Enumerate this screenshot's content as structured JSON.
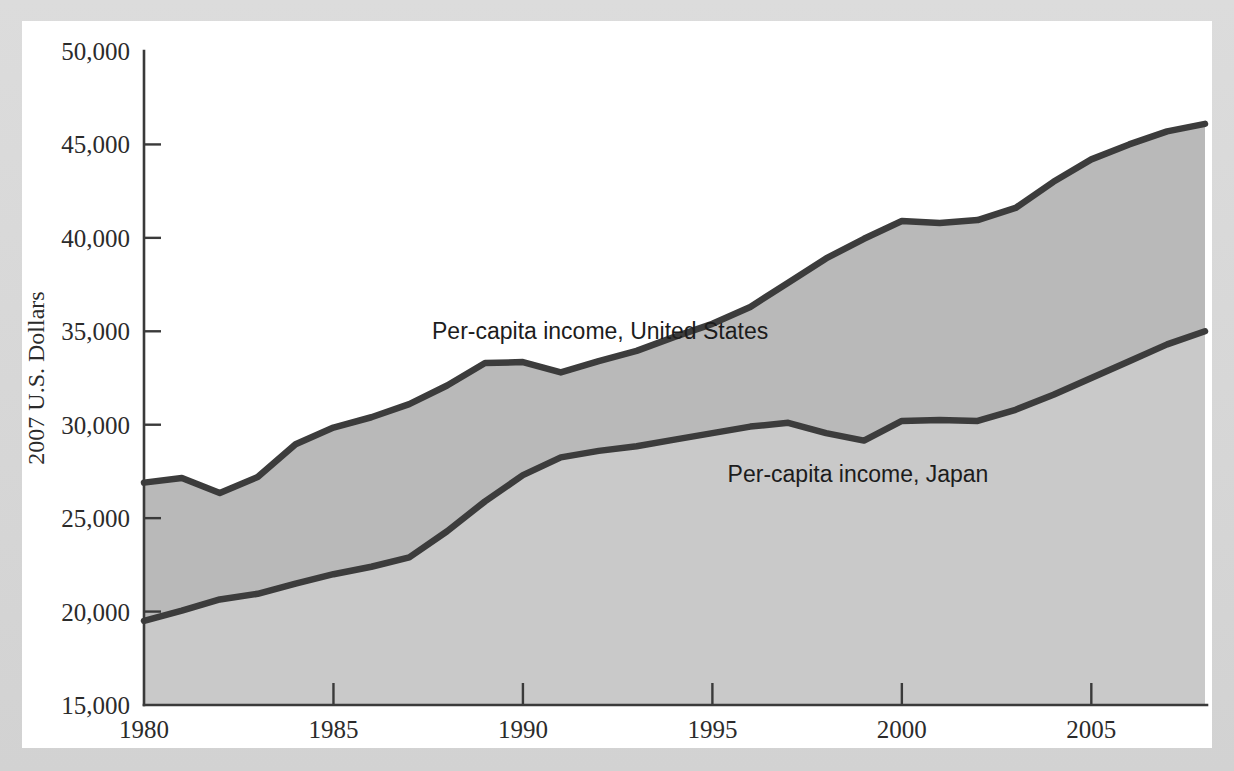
{
  "chart_data": {
    "type": "area",
    "title": "",
    "subtitle": "",
    "xlabel": "",
    "ylabel": "2007 U.S. Dollars",
    "xlim": [
      1980,
      2008
    ],
    "ylim": [
      15000,
      50000
    ],
    "grid": false,
    "legend_position": "inline-annotations",
    "y_ticks": [
      "50,000",
      "45,000",
      "40,000",
      "35,000",
      "30,000",
      "25,000",
      "20,000",
      "15,000"
    ],
    "y_tick_values": [
      50000,
      45000,
      40000,
      35000,
      30000,
      25000,
      20000,
      15000
    ],
    "x_ticks": [
      "1980",
      "1985",
      "1990",
      "1995",
      "2000",
      "2005"
    ],
    "x_tick_values": [
      1980,
      1985,
      1990,
      1995,
      2000,
      2005
    ],
    "x": [
      1980,
      1981,
      1982,
      1983,
      1984,
      1985,
      1986,
      1987,
      1988,
      1989,
      1990,
      1991,
      1992,
      1993,
      1994,
      1995,
      1996,
      1997,
      1998,
      1999,
      2000,
      2001,
      2002,
      2003,
      2004,
      2005,
      2006,
      2007,
      2008
    ],
    "series": [
      {
        "name": "Per-capita income, United States",
        "annotation": "Per-capita income, United States",
        "fill_color": "#b9b9b9",
        "line_color": "#3c3c3c",
        "values": [
          26900,
          27150,
          26350,
          27200,
          28950,
          29850,
          30400,
          31100,
          32100,
          33300,
          33350,
          32800,
          33400,
          33950,
          34700,
          35400,
          36300,
          37600,
          38900,
          39950,
          40900,
          40800,
          40950,
          41600,
          43000,
          44200,
          45000,
          45700,
          46100
        ]
      },
      {
        "name": "Per-capita income, Japan",
        "annotation": "Per-capita income, Japan",
        "fill_color": "#c9c9c9",
        "line_color": "#3c3c3c",
        "values": [
          19500,
          20050,
          20650,
          20950,
          21500,
          22000,
          22400,
          22900,
          24300,
          25900,
          27300,
          28250,
          28600,
          28850,
          29200,
          29550,
          29900,
          30100,
          29550,
          29150,
          30200,
          30250,
          30200,
          30800,
          31600,
          32500,
          33400,
          34300,
          35000
        ]
      }
    ],
    "annotations": [
      {
        "text": "Per-capita income, United States",
        "x": 1987.6,
        "y": 34600
      },
      {
        "text": "Per-capita income, Japan",
        "x": 1995.4,
        "y": 26950
      }
    ],
    "colors": {
      "us_band": "#b9b9b9",
      "japan_band": "#c9c9c9",
      "line": "#3c3c3c",
      "axis": "#3a3a3a",
      "plot_background": "#ffffff",
      "page_border": "#d6d6d6"
    }
  }
}
